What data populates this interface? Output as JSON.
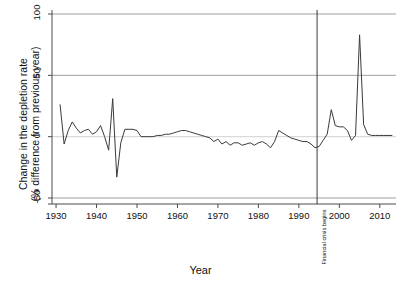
{
  "chart_data": {
    "type": "line",
    "title": "",
    "xlabel": "Year",
    "ylabel_line1": "Change in the depletion rate",
    "ylabel_line2": "(% difference from previous year)",
    "xlim": [
      1929,
      2014
    ],
    "ylim": [
      -50,
      100
    ],
    "xticks": [
      1930,
      1940,
      1950,
      1960,
      1970,
      1980,
      1990,
      2000,
      2010
    ],
    "yticks": [
      -50,
      0,
      50,
      100
    ],
    "grid": "horizontal",
    "legend": "none",
    "line_color": "#3a3a3a",
    "grid_color": "#9a9a9a",
    "axis_color": "#4a4a4a",
    "annotations": [
      {
        "label": "Financial crisis begins",
        "x": 1994.5,
        "orientation": "vertical-rule"
      }
    ],
    "x": [
      1931,
      1932,
      1933,
      1934,
      1935,
      1936,
      1937,
      1938,
      1939,
      1940,
      1941,
      1942,
      1943,
      1944,
      1945,
      1946,
      1947,
      1948,
      1949,
      1950,
      1951,
      1952,
      1953,
      1954,
      1955,
      1956,
      1957,
      1958,
      1959,
      1960,
      1961,
      1962,
      1963,
      1964,
      1965,
      1966,
      1967,
      1968,
      1969,
      1970,
      1971,
      1972,
      1973,
      1974,
      1975,
      1976,
      1977,
      1978,
      1979,
      1980,
      1981,
      1982,
      1983,
      1984,
      1985,
      1986,
      1987,
      1988,
      1989,
      1990,
      1991,
      1992,
      1993,
      1994,
      1995,
      1996,
      1997,
      1998,
      1999,
      2000,
      2001,
      2002,
      2003,
      2004,
      2005,
      2006,
      2007,
      2008,
      2009,
      2010,
      2011,
      2012,
      2013
    ],
    "values": [
      26,
      -6,
      5,
      12,
      7,
      3,
      5,
      6,
      2,
      4,
      9,
      0,
      -11,
      31,
      -33,
      -5,
      6,
      6,
      6,
      5,
      0,
      0,
      0,
      0,
      1,
      1,
      2,
      2,
      3,
      4,
      5,
      5,
      4,
      3,
      2,
      1,
      0,
      -1,
      -4,
      -2,
      -6,
      -4,
      -7,
      -5,
      -5,
      -7,
      -6,
      -5,
      -7,
      -5,
      -4,
      -6,
      -9,
      -4,
      5,
      3,
      1,
      -1,
      -2,
      -3,
      -4,
      -4,
      -6,
      -9,
      -8,
      -3,
      2,
      22,
      9,
      8,
      8,
      5,
      -3,
      1,
      83,
      10,
      2,
      1,
      1,
      1,
      1,
      1,
      1
    ]
  }
}
